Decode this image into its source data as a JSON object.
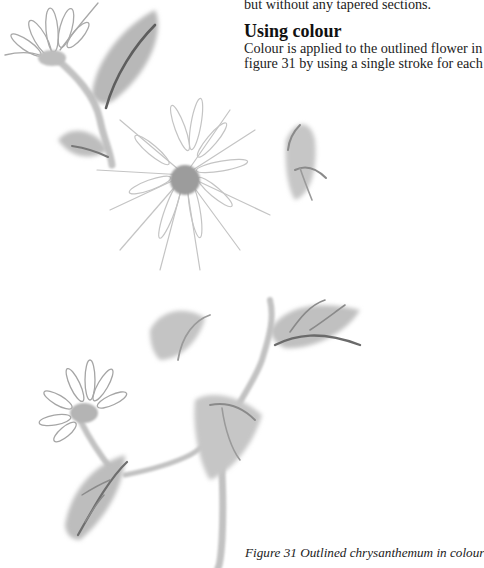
{
  "text": {
    "partial_line": "but without any tapered sections.",
    "heading": "Using colour",
    "paragraph_lines": [
      "Colour is applied to the outlined flower in",
      "figure 31 by using a single stroke for each"
    ]
  },
  "caption": "Figure 31  Outlined chrysanthemum in colour",
  "illustration": {
    "subject": "ink-wash chrysanthemum branch",
    "ink_dark": "#5a5a5a",
    "ink_mid": "#9a9a9a",
    "ink_light": "#cfcfcf",
    "background": "#ffffff"
  }
}
